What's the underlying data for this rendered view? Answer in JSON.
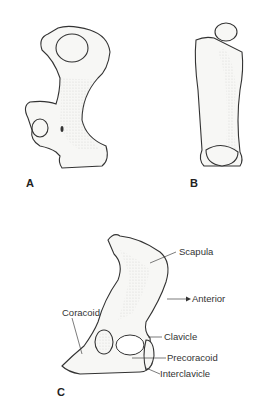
{
  "figure": {
    "panels": [
      {
        "id": "A",
        "label": "A",
        "subject": "humerus-view-1"
      },
      {
        "id": "B",
        "label": "B",
        "subject": "humerus-view-2"
      },
      {
        "id": "C",
        "label": "C",
        "subject": "pectoral-girdle"
      }
    ],
    "annotations": {
      "scapula": "Scapula",
      "anterior": "Anterior",
      "coracoid": "Coracoid",
      "clavicle": "Clavicle",
      "precoracoid": "Precoracoid",
      "interclavicle": "Interclavicle"
    },
    "colors": {
      "background": "#ffffff",
      "ink": "#333333"
    }
  }
}
